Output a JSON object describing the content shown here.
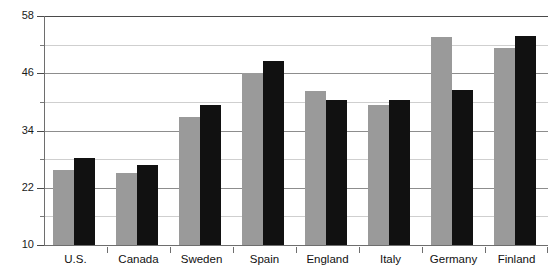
{
  "chart_data": {
    "type": "bar",
    "title": "",
    "subtitle": "",
    "xlabel": "",
    "ylabel": "",
    "categories": [
      "U.S.",
      "Canada",
      "Sweden",
      "Spain",
      "England",
      "Italy",
      "Germany",
      "Finland"
    ],
    "series": [
      {
        "name": "Series 1",
        "color": "#9a9a9a",
        "values": [
          25.7,
          25.1,
          36.8,
          46.0,
          42.3,
          39.4,
          53.6,
          51.3
        ]
      },
      {
        "name": "Series 2",
        "color": "#111111",
        "values": [
          28.2,
          26.7,
          39.3,
          48.5,
          40.4,
          40.4,
          42.5,
          53.8
        ]
      }
    ],
    "ylim": [
      10,
      58
    ],
    "yticks": [
      10,
      22,
      34,
      46,
      58
    ],
    "ytick_labels": [
      "10",
      "22",
      "34",
      "46",
      "58"
    ],
    "yminor": [
      16,
      28,
      40,
      52
    ],
    "grid": true,
    "legend": "none",
    "axis_color": "#6e6e6e",
    "gridline_color": "#8d8d8d",
    "minor_gridline_color": "#cfcfcf",
    "background": "#ffffff"
  }
}
